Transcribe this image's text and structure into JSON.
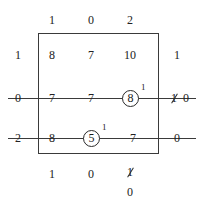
{
  "diagram": {
    "type": "annotated-matrix-tableau",
    "top_labels": [
      "1",
      "0",
      "2"
    ],
    "left_labels": [
      "1",
      "0",
      "2"
    ],
    "right_labels": [
      "1",
      "1",
      "0"
    ],
    "bottom_labels": [
      "1",
      "0",
      "1"
    ],
    "bottom_revised_label": "0",
    "right_row3_revised_label": "0",
    "rows": [
      {
        "left": "1",
        "cells": [
          "8",
          "7",
          "10"
        ],
        "right": "1"
      },
      {
        "left": "0",
        "cells": [
          "7",
          "7",
          "8"
        ],
        "right": "1"
      },
      {
        "left": "2",
        "cells": [
          "8",
          "5",
          "7"
        ],
        "right": "0"
      }
    ],
    "circled": [
      {
        "value": "8",
        "superscript": "1"
      },
      {
        "value": "5",
        "superscript": "1"
      }
    ],
    "struck_values": [
      {
        "value": "1",
        "replacement": "0",
        "position": "right-row2"
      },
      {
        "value": "1",
        "replacement": "0",
        "position": "bottom-col3"
      }
    ],
    "crossed_lines": 2
  }
}
